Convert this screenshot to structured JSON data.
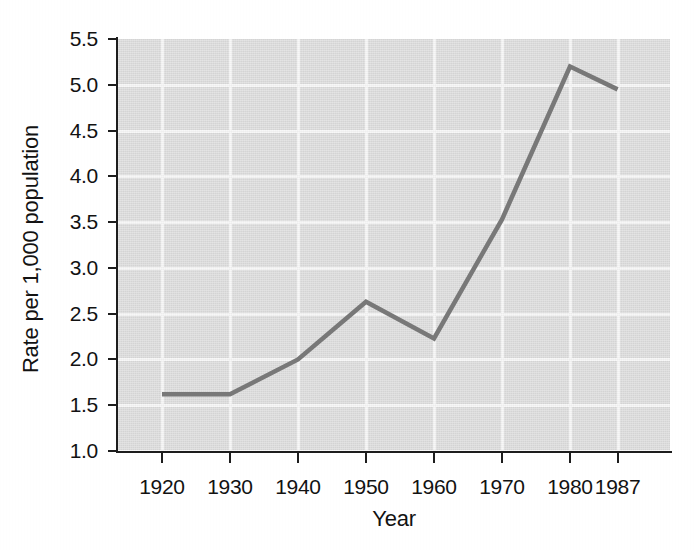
{
  "chart_data": {
    "type": "line",
    "title": "",
    "xlabel": "Year",
    "ylabel": "Rate per 1,000 population",
    "categories": [
      "1920",
      "1930",
      "1940",
      "1950",
      "1960",
      "1970",
      "1980",
      "1987"
    ],
    "values": [
      1.62,
      1.62,
      2.0,
      2.63,
      2.23,
      3.53,
      5.2,
      4.95
    ],
    "series": [
      {
        "name": "Rate per 1,000 population",
        "values": [
          1.62,
          1.62,
          2.0,
          2.63,
          2.23,
          3.53,
          5.2,
          4.95
        ]
      }
    ],
    "ylim": [
      1.0,
      5.5
    ],
    "ytick_labels": [
      "5.5",
      "5.0",
      "4.5",
      "4.0",
      "3.5",
      "3.0",
      "2.5",
      "2.0",
      "1.5",
      "1.0"
    ],
    "ytick_values": [
      5.5,
      5.0,
      4.5,
      4.0,
      3.5,
      3.0,
      2.5,
      2.0,
      1.5,
      1.0
    ],
    "xtick_labels": [
      "1920",
      "1930",
      "1940",
      "1950",
      "1960",
      "1970",
      "1980",
      "1987"
    ],
    "grid": true,
    "legend": false,
    "legend_position": "none",
    "line_color": "#787878",
    "plot_background": "#dcdcdc",
    "gridline_color": "#f6f6f6",
    "axis_color": "#1d1d1d",
    "figure_background": "#ffffff"
  }
}
